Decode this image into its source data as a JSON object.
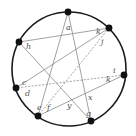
{
  "diagram": {
    "colors": {
      "circle": "#1a1a1a",
      "lines": "#8a8a8a",
      "points": "#111111",
      "labels": "#555555"
    },
    "circle": {
      "cx": 69,
      "cy": 69,
      "r": 57
    },
    "points": [
      {
        "id": "P1",
        "x": 68,
        "y": 12
      },
      {
        "id": "P2",
        "x": 109,
        "y": 28
      },
      {
        "id": "P3",
        "x": 124,
        "y": 75
      },
      {
        "id": "P4",
        "x": 91,
        "y": 121
      },
      {
        "id": "P5",
        "x": 38,
        "y": 116
      },
      {
        "id": "P6",
        "x": 16,
        "y": 88
      },
      {
        "id": "P7",
        "x": 19,
        "y": 42
      }
    ],
    "segments": [
      {
        "from": "P1",
        "to": "P5",
        "style": "solid"
      },
      {
        "from": "P1",
        "to": "P4",
        "style": "solid"
      },
      {
        "from": "P2",
        "to": "P7",
        "style": "solid"
      },
      {
        "from": "P2",
        "to": "P5",
        "style": "dashed"
      },
      {
        "from": "P3",
        "to": "P6",
        "style": "dashed"
      },
      {
        "from": "P3",
        "to": "P5",
        "style": "solid"
      },
      {
        "from": "P7",
        "to": "P4",
        "style": "solid"
      },
      {
        "from": "P6",
        "to": "P2",
        "style": "solid"
      }
    ],
    "labels": [
      {
        "text": "a",
        "x": 66,
        "y": 30
      },
      {
        "text": "h",
        "x": 26,
        "y": 49
      },
      {
        "text": "k",
        "x": 96,
        "y": 34
      },
      {
        "text": "j",
        "x": 101,
        "y": 44
      },
      {
        "text": "i",
        "x": 113,
        "y": 73
      },
      {
        "text": "k",
        "x": 106,
        "y": 82
      },
      {
        "text": "x",
        "x": 88,
        "y": 100
      },
      {
        "text": "g",
        "x": 86,
        "y": 116
      },
      {
        "text": "y",
        "x": 67,
        "y": 108
      },
      {
        "text": "f",
        "x": 47,
        "y": 110
      },
      {
        "text": "e",
        "x": 37,
        "y": 110
      },
      {
        "text": "d",
        "x": 25,
        "y": 96
      },
      {
        "text": "c",
        "x": 22,
        "y": 85
      }
    ]
  }
}
